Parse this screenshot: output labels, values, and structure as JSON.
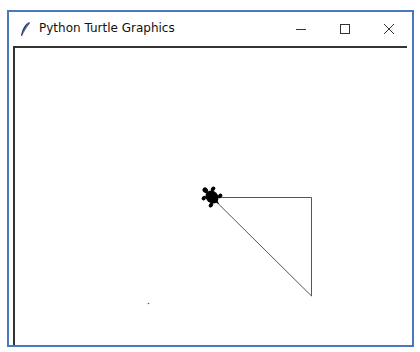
{
  "window": {
    "title": "Python Turtle Graphics",
    "icon": "feather-icon",
    "controls": [
      {
        "name": "minimize",
        "icon": "minimize-icon"
      },
      {
        "name": "maximize",
        "icon": "maximize-icon"
      },
      {
        "name": "close",
        "icon": "close-icon"
      }
    ],
    "border_color": "#4a78c0"
  },
  "canvas": {
    "background": "#ffffff",
    "turtle": {
      "shape": "turtle",
      "heading": "up-left",
      "x": 212,
      "y": 197,
      "color": "#000000"
    },
    "lines": [
      {
        "from": [
          212,
          197
        ],
        "to": [
          311,
          197
        ]
      },
      {
        "from": [
          311,
          197
        ],
        "to": [
          311,
          296
        ]
      },
      {
        "from": [
          311,
          296
        ],
        "to": [
          212,
          197
        ]
      }
    ],
    "dot": {
      "x": 148,
      "y": 303
    }
  }
}
